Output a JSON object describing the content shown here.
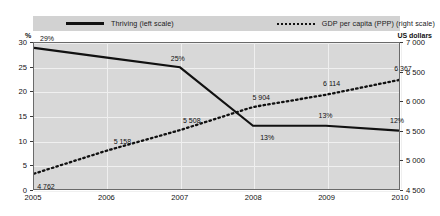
{
  "legend": {
    "items": [
      {
        "label": "Thriving (left scale)",
        "marker": "solid-line",
        "color": "#111111"
      },
      {
        "label": "GDP per capita (PPP) (right scale)",
        "marker": "dotted-line",
        "color": "#111111"
      }
    ]
  },
  "axis_captions": {
    "left": "%",
    "right": "US dollars"
  },
  "chart_data": {
    "type": "line",
    "title": "",
    "xlabel": "",
    "grid": true,
    "legend_position": "top",
    "categories": [
      "2005",
      "2006",
      "2007",
      "2008",
      "2009",
      "2010"
    ],
    "series": [
      {
        "name": "Thriving (left scale)",
        "axis": "left",
        "unit": "%",
        "style": "solid",
        "color": "#111111",
        "values": [
          29,
          27,
          25,
          13,
          13,
          12
        ],
        "point_labels": [
          "29%",
          "",
          "25%",
          "13%",
          "13%",
          "12%"
        ]
      },
      {
        "name": "GDP per capita (PPP) (right scale)",
        "axis": "right",
        "unit": "US dollars",
        "style": "dotted",
        "color": "#111111",
        "values": [
          4762,
          5158,
          5508,
          5904,
          6114,
          6367
        ],
        "point_labels": [
          "4 762",
          "5 158",
          "5 508",
          "5 904",
          "6 114",
          "6 367"
        ]
      }
    ],
    "left_axis": {
      "label": "%",
      "ticks": [
        "0",
        "5",
        "10",
        "15",
        "20",
        "25",
        "30"
      ],
      "ylim": [
        0,
        30
      ]
    },
    "right_axis": {
      "label": "US dollars",
      "ticks": [
        "4 500",
        "5 000",
        "5 500",
        "6 000",
        "6 500",
        "7 000"
      ],
      "ylim": [
        4500,
        7000
      ]
    }
  }
}
